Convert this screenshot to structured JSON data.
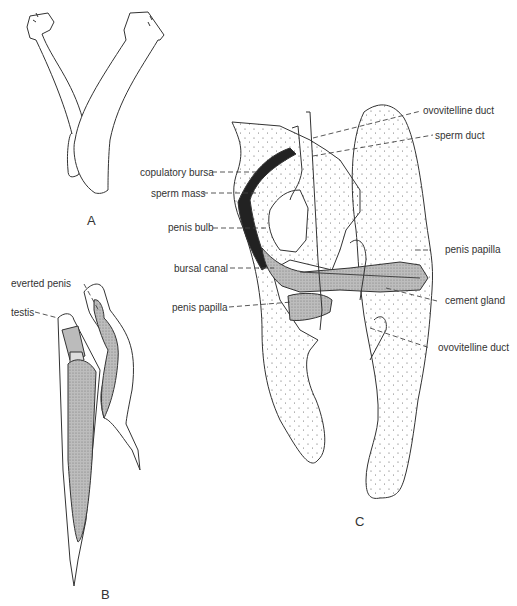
{
  "figure": {
    "panels": [
      {
        "id": "A",
        "label": "A"
      },
      {
        "id": "B",
        "label": "B"
      },
      {
        "id": "C",
        "label": "C"
      }
    ],
    "panel_b_labels": {
      "everted_penis": "everted penis",
      "testis": "testis"
    },
    "panel_c_left_labels": {
      "copulatory_bursa": "copulatory bursa",
      "sperm_mass": "sperm mass",
      "penis_bulb": "penis bulb",
      "bursal_canal": "bursal canal",
      "penis_papilla": "penis papilla"
    },
    "panel_c_right_labels": {
      "ovovitelline_duct_top": "ovovitelline duct",
      "sperm_duct": "sperm duct",
      "penis_papilla": "penis papilla",
      "cement_gland": "cement gland",
      "ovovitelline_duct_bottom": "ovovitelline duct"
    },
    "colors": {
      "line": "#333333",
      "shade_dark": "#222222",
      "shade_mid": "#8a8a8a",
      "shade_light": "#c8c8c8",
      "background": "#ffffff"
    }
  }
}
